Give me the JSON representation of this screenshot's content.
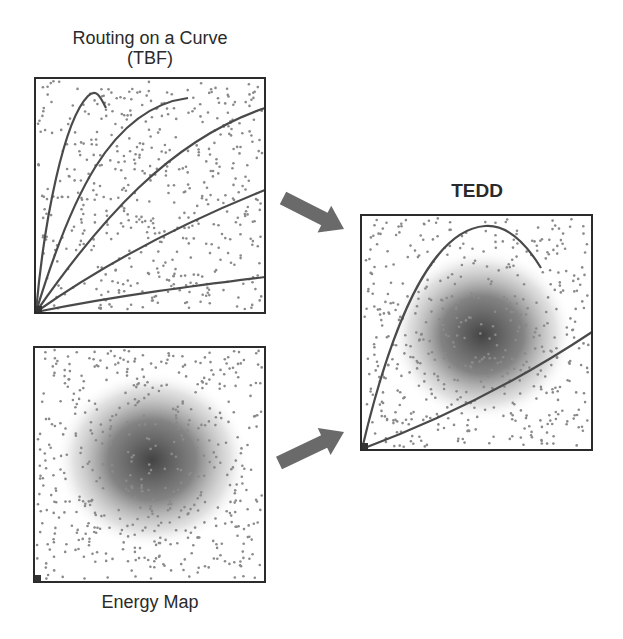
{
  "panels": {
    "routing": {
      "title_line1": "Routing on a Curve",
      "title_line2": "(TBF)",
      "box": {
        "x": 35,
        "y": 78,
        "w": 230,
        "h": 235
      },
      "curves": [
        "M36,312 C44,220 64,120 88,96 C96,88 100,96 106,108",
        "M36,312 C70,200 110,108 188,98",
        "M36,312 C100,220 170,140 265,108",
        "M36,312 C110,260 190,220 265,190",
        "M36,312 C120,295 200,285 265,277"
      ]
    },
    "energy": {
      "title": "Energy Map",
      "box": {
        "x": 34,
        "y": 347,
        "w": 231,
        "h": 235
      },
      "blob": {
        "cx": 152,
        "cy": 460,
        "rx": 72,
        "ry": 66
      }
    },
    "tedd": {
      "title": "TEDD",
      "box": {
        "x": 361,
        "y": 215,
        "w": 231,
        "h": 235
      },
      "blob": {
        "cx": 482,
        "cy": 335,
        "rx": 68,
        "ry": 64
      },
      "curves": [
        "M362,449 C390,330 430,230 485,226 C510,224 530,250 541,268",
        "M362,449 C440,420 520,380 592,332"
      ]
    }
  },
  "arrows": [
    {
      "name": "arrow-routing-to-tedd",
      "from": [
        283,
        198
      ],
      "to": [
        344,
        229
      ]
    },
    {
      "name": "arrow-energy-to-tedd",
      "from": [
        279,
        463
      ],
      "to": [
        344,
        432
      ]
    }
  ],
  "colors": {
    "border": "#2b2b2b",
    "curve": "#4a4a4a",
    "dot": "#8a8a8a",
    "arrow": "#6a6a6a",
    "blob_core": "#3a3a3a"
  }
}
